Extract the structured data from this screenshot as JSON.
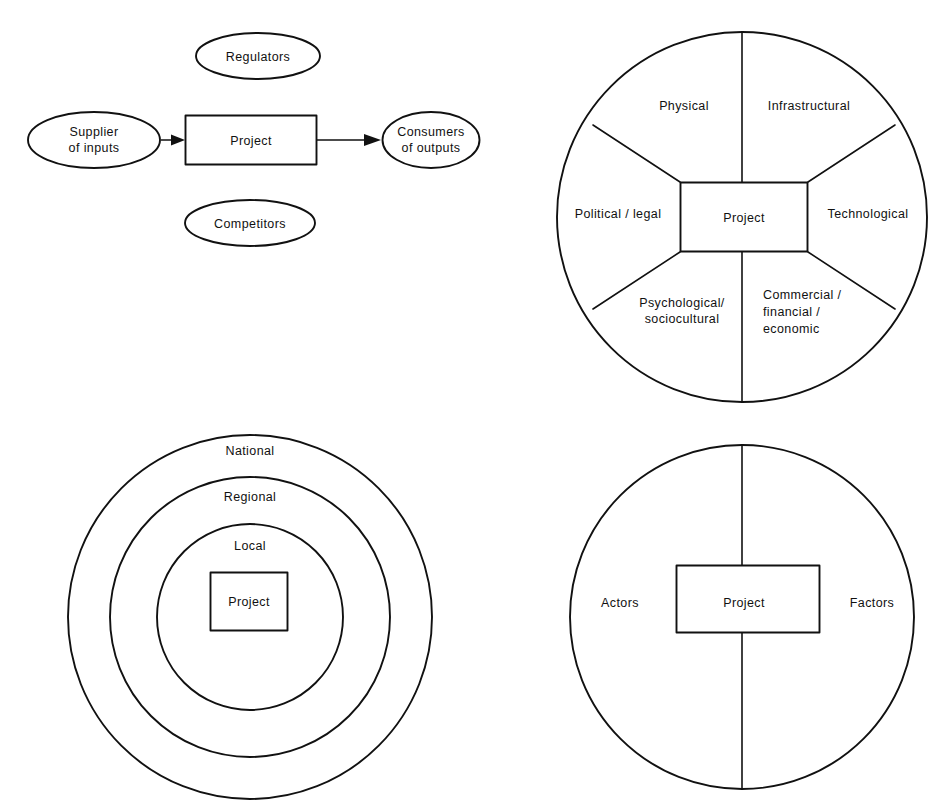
{
  "figure": {
    "panels": [
      {
        "id": "project-and-stakeholders",
        "position": "top-left",
        "type": "process-flow",
        "center_node": {
          "label": "Project",
          "shape": "rectangle"
        },
        "input_node": {
          "label_line1": "Supplier",
          "label_line2": "of inputs",
          "shape": "ellipse"
        },
        "output_node": {
          "label_line1": "Consumers",
          "label_line2": "of outputs",
          "shape": "ellipse"
        },
        "top_node": {
          "label": "Regulators",
          "shape": "ellipse"
        },
        "bottom_node": {
          "label": "Competitors",
          "shape": "ellipse"
        },
        "arrows": [
          {
            "from": "Supplier of inputs",
            "to": "Project",
            "direction": "right"
          },
          {
            "from": "Project",
            "to": "Consumers of outputs",
            "direction": "right"
          }
        ]
      },
      {
        "id": "project-environment-sectors",
        "position": "top-right",
        "type": "sector-circle",
        "center_node": {
          "label": "Project",
          "shape": "rectangle"
        },
        "sectors": [
          {
            "index": 0,
            "label": "Physical",
            "lines": [
              "Physical"
            ],
            "location": "top-left"
          },
          {
            "index": 1,
            "label": "Infrastructural",
            "lines": [
              "Infrastructural"
            ],
            "location": "top-right"
          },
          {
            "index": 2,
            "label": "Political / legal",
            "lines": [
              "Political / legal"
            ],
            "location": "left"
          },
          {
            "index": 3,
            "label": "Technological",
            "lines": [
              "Technological"
            ],
            "location": "right"
          },
          {
            "index": 4,
            "label": "Psychological/ sociocultural",
            "lines": [
              "Psychological/",
              "sociocultural"
            ],
            "location": "bottom-left"
          },
          {
            "index": 5,
            "label": "Commercial / financial / economic",
            "lines": [
              "Commercial /",
              "financial /",
              "economic"
            ],
            "location": "bottom-right"
          }
        ]
      },
      {
        "id": "project-spatial-levels",
        "position": "bottom-left",
        "type": "concentric-circles",
        "center_node": {
          "label": "Project",
          "shape": "rectangle"
        },
        "rings": [
          {
            "index": 0,
            "label": "National",
            "ring": "outer"
          },
          {
            "index": 1,
            "label": "Regional",
            "ring": "middle"
          },
          {
            "index": 2,
            "label": "Local",
            "ring": "inner"
          }
        ]
      },
      {
        "id": "project-actors-factors",
        "position": "bottom-right",
        "type": "split-circle",
        "center_node": {
          "label": "Project",
          "shape": "rectangle"
        },
        "halves": [
          {
            "index": 0,
            "label": "Actors",
            "side": "left"
          },
          {
            "index": 1,
            "label": "Factors",
            "side": "right"
          }
        ]
      }
    ]
  },
  "style": {
    "stroke_color": "#111111",
    "background_color": "#ffffff",
    "fill_color": "#ffffff"
  }
}
